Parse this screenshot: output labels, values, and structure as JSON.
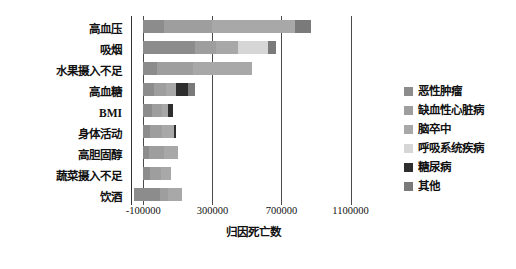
{
  "chart_data": {
    "type": "bar",
    "orientation": "horizontal",
    "stacked": true,
    "title": "",
    "xlabel": "归因死亡数",
    "ylabel": "",
    "xlim": [
      -160000,
      1230000
    ],
    "xticks": [
      -100000,
      300000,
      700000,
      1100000
    ],
    "xtick_labels": [
      "-100000",
      "300000",
      "700000",
      "1100000"
    ],
    "grid": true,
    "grid_axis": "x",
    "legend_position": "right",
    "categories": [
      "高血压",
      "吸烟",
      "水果摄入不足",
      "高血糖",
      "BMI",
      "身体活动",
      "高胆固醇",
      "蔬菜摄入不足",
      "饮酒"
    ],
    "series": [
      {
        "name": "恶性肿瘤",
        "color": "#8c8c8c",
        "values": [
          120000,
          300000,
          80000,
          60000,
          50000,
          40000,
          30000,
          40000,
          150000
        ]
      },
      {
        "name": "缺血性心脏病",
        "color": "#9e9e9e",
        "values": [
          280000,
          120000,
          210000,
          70000,
          60000,
          70000,
          90000,
          60000,
          50000
        ]
      },
      {
        "name": "脑卒中",
        "color": "#a8a8a8",
        "values": [
          480000,
          130000,
          340000,
          60000,
          30000,
          70000,
          80000,
          60000,
          80000
        ]
      },
      {
        "name": "呼吸系统疾病",
        "color": "#d6d6d6",
        "values": [
          0,
          170000,
          0,
          0,
          0,
          0,
          0,
          0,
          0
        ]
      },
      {
        "name": "糖尿病",
        "color": "#2e2e2e",
        "values": [
          0,
          0,
          0,
          70000,
          30000,
          10000,
          0,
          0,
          0
        ]
      },
      {
        "name": "其他",
        "color": "#7a7a7a",
        "values": [
          90000,
          50000,
          0,
          40000,
          0,
          0,
          0,
          0,
          0
        ]
      }
    ],
    "bar_totals": [
      970000,
      770000,
      630000,
      300000,
      170000,
      190000,
      200000,
      160000,
      280000
    ],
    "bar_starts": [
      -100000,
      -100000,
      -100000,
      -100000,
      -100000,
      -100000,
      -100000,
      -100000,
      -155000
    ]
  },
  "legend": {
    "items": [
      {
        "label": "恶性肿瘤"
      },
      {
        "label": "缺血性心脏病"
      },
      {
        "label": "脑卒中"
      },
      {
        "label": "呼吸系统疾病"
      },
      {
        "label": "糖尿病"
      },
      {
        "label": "其他"
      }
    ]
  }
}
